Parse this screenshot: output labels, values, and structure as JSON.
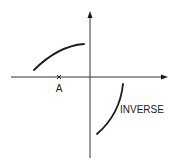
{
  "diagram": {
    "type": "function-and-inverse-sketch",
    "labels": {
      "point_a": "A",
      "curve_label": "INVERSE"
    },
    "colors": {
      "stroke": "#1a1a1a",
      "axis": "#333333",
      "background": "#ffffff"
    },
    "elements": [
      {
        "id": "x-axis",
        "kind": "axis",
        "direction": "horizontal",
        "arrow": "right"
      },
      {
        "id": "y-axis",
        "kind": "axis",
        "direction": "vertical",
        "arrow": "up"
      },
      {
        "id": "original-curve",
        "kind": "curve",
        "quadrant": "II",
        "shape": "concave-down increasing"
      },
      {
        "id": "inverse-curve",
        "kind": "curve",
        "quadrant": "IV",
        "shape": "increasing, steep"
      },
      {
        "id": "point-a",
        "kind": "tick-mark",
        "on": "x-axis",
        "label": "A"
      }
    ]
  }
}
